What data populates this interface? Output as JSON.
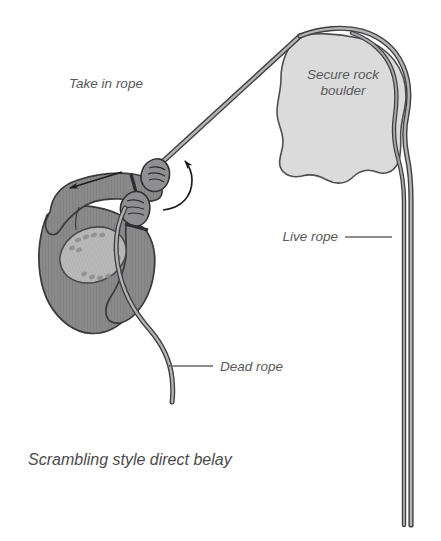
{
  "figure": {
    "caption": "Scrambling style direct belay",
    "background_color": "#ffffff",
    "labels": {
      "take_in_rope": "Take in rope",
      "secure_rock_boulder_line1": "Secure rock",
      "secure_rock_boulder_line2": "boulder",
      "live_rope": "Live rope",
      "dead_rope": "Dead rope"
    },
    "colors": {
      "boulder_fill": "#dcdcdc",
      "boulder_outline": "#4f4f51",
      "body_fill": "#8a8a8a",
      "body_outline": "#3a3a3c",
      "pack_fill": "#b9b9b9",
      "rope_fill": "#9a9a9a",
      "rope_outline": "#3f3f41",
      "text_color": "#58585a",
      "leader_line_color": "#6a6a6c",
      "arrow_color": "#1c1c1e"
    },
    "annotations": {
      "take_in_rope_arrow": "straight-arrow-down-left",
      "pull_rope_arrow": "curved-arrow-up"
    },
    "elements": {
      "boulder_name": "secure-rock-boulder",
      "climber_name": "belayer-figure",
      "live_rope_name": "live-rope-strand",
      "dead_rope_name": "dead-rope-strand"
    }
  }
}
